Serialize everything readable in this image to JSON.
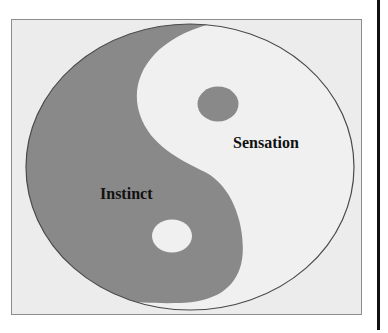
{
  "diagram": {
    "type": "yin-yang",
    "labels": {
      "dark_half": "Instinct",
      "light_half": "Sensation"
    },
    "colors": {
      "dark": "#898989",
      "light": "#f0f0f0",
      "outline": "#4a4a4a",
      "frame_background": "#ececec",
      "frame_border": "#8c8c8c",
      "side_rule": "#111111"
    }
  }
}
